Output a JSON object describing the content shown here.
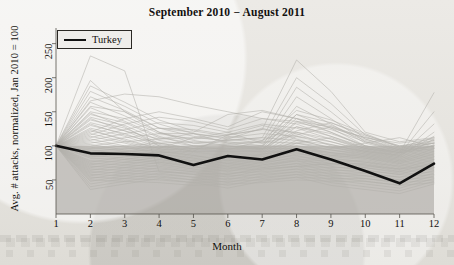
{
  "chart": {
    "title": "September 2010 − August 2011",
    "xlabel": "Month",
    "ylabel": "Avg. # attacks, normalized, Jan 2010 = 100",
    "legend_label": "Turkey"
  },
  "chart_data": {
    "type": "line",
    "title": "September 2010 − August 2011",
    "xlabel": "Month",
    "ylabel": "Avg. # attacks, normalized, Jan 2010 = 100",
    "xlim": [
      1,
      12
    ],
    "ylim": [
      0,
      270
    ],
    "xticks": [
      1,
      2,
      3,
      4,
      5,
      6,
      7,
      8,
      9,
      10,
      11,
      12
    ],
    "yticks": [
      50,
      100,
      150,
      200,
      250
    ],
    "grid": false,
    "legend": {
      "position": "top-left",
      "entries": [
        "Turkey"
      ]
    },
    "shaded_band": {
      "y_from": 0,
      "y_to": 100,
      "color": "#a9a7a1",
      "opacity": 0.62
    },
    "x": [
      1,
      2,
      3,
      4,
      5,
      6,
      7,
      8,
      9,
      10,
      11,
      12
    ],
    "highlight_series": {
      "name": "Turkey",
      "color": "#111111",
      "width": 2.6,
      "values": [
        100,
        89,
        88,
        86,
        72,
        85,
        80,
        95,
        80,
        63,
        45,
        74
      ]
    },
    "background_series_note": "~60 unlabeled country series drawn in light grey, all normalized to 100 at month 1",
    "series": [
      {
        "name": "country-01",
        "color": "#b3b1ab",
        "values": [
          100,
          232,
          210,
          62,
          60,
          58,
          66,
          70,
          74,
          70,
          66,
          72
        ]
      },
      {
        "name": "country-02",
        "color": "#b3b1ab",
        "values": [
          100,
          196,
          150,
          120,
          104,
          100,
          96,
          104,
          112,
          96,
          90,
          100
        ]
      },
      {
        "name": "country-03",
        "color": "#b3b1ab",
        "values": [
          100,
          166,
          176,
          172,
          160,
          150,
          140,
          136,
          128,
          112,
          100,
          104
        ]
      },
      {
        "name": "country-04",
        "color": "#b3b1ab",
        "values": [
          100,
          158,
          150,
          126,
          120,
          146,
          152,
          140,
          126,
          112,
          104,
          110
        ]
      },
      {
        "name": "country-05",
        "color": "#b3b1ab",
        "values": [
          100,
          150,
          140,
          118,
          110,
          116,
          124,
          226,
          180,
          120,
          106,
          112
        ]
      },
      {
        "name": "country-06",
        "color": "#b3b1ab",
        "values": [
          100,
          146,
          134,
          112,
          104,
          108,
          112,
          200,
          162,
          116,
          100,
          108
        ]
      },
      {
        "name": "country-07",
        "color": "#b3b1ab",
        "values": [
          100,
          142,
          130,
          108,
          100,
          102,
          106,
          186,
          150,
          110,
          96,
          104
        ]
      },
      {
        "name": "country-08",
        "color": "#b3b1ab",
        "values": [
          100,
          138,
          126,
          104,
          96,
          98,
          100,
          172,
          140,
          106,
          94,
          100
        ]
      },
      {
        "name": "country-09",
        "color": "#b3b1ab",
        "values": [
          100,
          134,
          122,
          102,
          94,
          96,
          98,
          158,
          132,
          104,
          92,
          98
        ]
      },
      {
        "name": "country-10",
        "color": "#b3b1ab",
        "values": [
          100,
          130,
          118,
          100,
          92,
          94,
          96,
          146,
          126,
          100,
          90,
          96
        ]
      },
      {
        "name": "country-11",
        "color": "#b3b1ab",
        "values": [
          100,
          126,
          114,
          98,
          90,
          92,
          94,
          136,
          120,
          98,
          88,
          94
        ]
      },
      {
        "name": "country-12",
        "color": "#b3b1ab",
        "values": [
          100,
          122,
          110,
          96,
          88,
          90,
          92,
          128,
          114,
          96,
          86,
          92
        ]
      },
      {
        "name": "country-13",
        "color": "#b3b1ab",
        "values": [
          100,
          118,
          106,
          94,
          86,
          88,
          90,
          120,
          110,
          94,
          84,
          90
        ]
      },
      {
        "name": "country-14",
        "color": "#b3b1ab",
        "values": [
          100,
          114,
          104,
          92,
          84,
          86,
          88,
          114,
          106,
          92,
          82,
          88
        ]
      },
      {
        "name": "country-15",
        "color": "#b3b1ab",
        "values": [
          100,
          110,
          100,
          90,
          82,
          84,
          86,
          108,
          102,
          90,
          80,
          86
        ]
      },
      {
        "name": "country-16",
        "color": "#b3b1ab",
        "values": [
          100,
          106,
          98,
          88,
          80,
          82,
          84,
          104,
          98,
          88,
          78,
          84
        ]
      },
      {
        "name": "country-17",
        "color": "#b3b1ab",
        "values": [
          100,
          102,
          94,
          86,
          78,
          80,
          82,
          100,
          94,
          86,
          76,
          82
        ]
      },
      {
        "name": "country-18",
        "color": "#b3b1ab",
        "values": [
          100,
          98,
          92,
          84,
          76,
          78,
          80,
          96,
          90,
          84,
          74,
          80
        ]
      },
      {
        "name": "country-19",
        "color": "#b3b1ab",
        "values": [
          100,
          94,
          88,
          82,
          74,
          76,
          78,
          92,
          86,
          82,
          72,
          78
        ]
      },
      {
        "name": "country-20",
        "color": "#b3b1ab",
        "values": [
          100,
          90,
          86,
          80,
          72,
          74,
          76,
          88,
          84,
          80,
          70,
          76
        ]
      },
      {
        "name": "country-21",
        "color": "#b3b1ab",
        "values": [
          100,
          86,
          82,
          78,
          70,
          72,
          74,
          84,
          80,
          78,
          68,
          74
        ]
      },
      {
        "name": "country-22",
        "color": "#b3b1ab",
        "values": [
          100,
          82,
          80,
          76,
          68,
          70,
          72,
          80,
          78,
          76,
          66,
          72
        ]
      },
      {
        "name": "country-23",
        "color": "#b3b1ab",
        "values": [
          100,
          78,
          76,
          74,
          66,
          68,
          70,
          78,
          74,
          74,
          64,
          70
        ]
      },
      {
        "name": "country-24",
        "color": "#b3b1ab",
        "values": [
          100,
          74,
          72,
          70,
          64,
          66,
          68,
          74,
          72,
          72,
          62,
          68
        ]
      },
      {
        "name": "country-25",
        "color": "#b3b1ab",
        "values": [
          100,
          70,
          68,
          66,
          62,
          64,
          66,
          70,
          68,
          68,
          60,
          66
        ]
      },
      {
        "name": "country-26",
        "color": "#b3b1ab",
        "values": [
          100,
          66,
          64,
          62,
          58,
          60,
          62,
          66,
          64,
          64,
          58,
          62
        ]
      },
      {
        "name": "country-27",
        "color": "#b3b1ab",
        "values": [
          100,
          62,
          60,
          58,
          54,
          56,
          58,
          62,
          60,
          60,
          54,
          58
        ]
      },
      {
        "name": "country-28",
        "color": "#b3b1ab",
        "values": [
          100,
          58,
          56,
          54,
          50,
          52,
          54,
          58,
          56,
          56,
          50,
          54
        ]
      },
      {
        "name": "country-29",
        "color": "#b3b1ab",
        "values": [
          100,
          54,
          52,
          50,
          46,
          48,
          50,
          54,
          52,
          52,
          46,
          50
        ]
      },
      {
        "name": "country-30",
        "color": "#b3b1ab",
        "values": [
          100,
          50,
          48,
          46,
          42,
          44,
          46,
          50,
          48,
          48,
          42,
          46
        ]
      },
      {
        "name": "country-31",
        "color": "#b3b1ab",
        "values": [
          100,
          120,
          140,
          150,
          140,
          128,
          150,
          140,
          120,
          100,
          92,
          100
        ]
      },
      {
        "name": "country-32",
        "color": "#b3b1ab",
        "values": [
          100,
          116,
          132,
          142,
          136,
          124,
          140,
          132,
          114,
          98,
          90,
          178
        ]
      },
      {
        "name": "country-33",
        "color": "#b3b1ab",
        "values": [
          100,
          112,
          124,
          134,
          130,
          120,
          132,
          126,
          110,
          96,
          88,
          150
        ]
      },
      {
        "name": "country-34",
        "color": "#b3b1ab",
        "values": [
          100,
          108,
          118,
          126,
          124,
          116,
          124,
          120,
          106,
          94,
          86,
          132
        ]
      },
      {
        "name": "country-35",
        "color": "#b3b1ab",
        "values": [
          100,
          104,
          112,
          118,
          118,
          112,
          118,
          114,
          102,
          92,
          84,
          120
        ]
      },
      {
        "name": "country-36",
        "color": "#b3b1ab",
        "values": [
          100,
          100,
          106,
          110,
          112,
          108,
          112,
          108,
          98,
          90,
          82,
          110
        ]
      },
      {
        "name": "country-37",
        "color": "#b3b1ab",
        "values": [
          100,
          96,
          100,
          104,
          106,
          104,
          106,
          104,
          94,
          88,
          80,
          102
        ]
      },
      {
        "name": "country-38",
        "color": "#b3b1ab",
        "values": [
          100,
          92,
          96,
          98,
          100,
          100,
          100,
          100,
          90,
          86,
          78,
          96
        ]
      },
      {
        "name": "country-39",
        "color": "#b3b1ab",
        "values": [
          100,
          88,
          92,
          94,
          96,
          96,
          96,
          96,
          88,
          84,
          76,
          92
        ]
      },
      {
        "name": "country-40",
        "color": "#b3b1ab",
        "values": [
          100,
          84,
          88,
          90,
          92,
          92,
          92,
          92,
          86,
          82,
          74,
          88
        ]
      },
      {
        "name": "country-41",
        "color": "#b3b1ab",
        "values": [
          100,
          124,
          108,
          96,
          112,
          120,
          104,
          116,
          128,
          108,
          94,
          104
        ]
      },
      {
        "name": "country-42",
        "color": "#b3b1ab",
        "values": [
          100,
          132,
          116,
          104,
          96,
          110,
          126,
          110,
          96,
          104,
          112,
          98
        ]
      },
      {
        "name": "country-43",
        "color": "#b3b1ab",
        "values": [
          100,
          140,
          122,
          110,
          118,
          104,
          96,
          122,
          134,
          116,
          98,
          106
        ]
      },
      {
        "name": "country-44",
        "color": "#b3b1ab",
        "values": [
          100,
          148,
          128,
          100,
          92,
          116,
          130,
          118,
          100,
          92,
          86,
          114
        ]
      },
      {
        "name": "country-45",
        "color": "#b3b1ab",
        "values": [
          100,
          156,
          136,
          114,
          100,
          94,
          108,
          128,
          118,
          100,
          90,
          96
        ]
      },
      {
        "name": "country-46",
        "color": "#b3b1ab",
        "values": [
          100,
          164,
          144,
          120,
          108,
          100,
          94,
          134,
          124,
          106,
          92,
          100
        ]
      },
      {
        "name": "country-47",
        "color": "#b3b1ab",
        "values": [
          100,
          172,
          152,
          126,
          114,
          106,
          100,
          140,
          130,
          110,
          94,
          104
        ]
      },
      {
        "name": "country-48",
        "color": "#b3b1ab",
        "values": [
          100,
          180,
          158,
          132,
          118,
          110,
          104,
          146,
          134,
          114,
          96,
          108
        ]
      },
      {
        "name": "country-49",
        "color": "#b3b1ab",
        "values": [
          100,
          188,
          164,
          138,
          122,
          114,
          108,
          152,
          138,
          118,
          98,
          112
        ]
      },
      {
        "name": "country-50",
        "color": "#b3b1ab",
        "values": [
          100,
          76,
          84,
          92,
          86,
          78,
          88,
          94,
          82,
          76,
          70,
          84
        ]
      },
      {
        "name": "country-51",
        "color": "#b3b1ab",
        "values": [
          100,
          72,
          80,
          88,
          82,
          74,
          84,
          90,
          78,
          72,
          66,
          80
        ]
      },
      {
        "name": "country-52",
        "color": "#b3b1ab",
        "values": [
          100,
          68,
          76,
          84,
          78,
          70,
          80,
          86,
          74,
          68,
          62,
          76
        ]
      },
      {
        "name": "country-53",
        "color": "#b3b1ab",
        "values": [
          100,
          64,
          72,
          80,
          74,
          66,
          76,
          82,
          70,
          64,
          58,
          72
        ]
      },
      {
        "name": "country-54",
        "color": "#b3b1ab",
        "values": [
          100,
          60,
          68,
          76,
          70,
          62,
          72,
          78,
          66,
          60,
          54,
          68
        ]
      },
      {
        "name": "country-55",
        "color": "#b3b1ab",
        "values": [
          100,
          56,
          64,
          72,
          66,
          58,
          68,
          74,
          62,
          56,
          50,
          64
        ]
      },
      {
        "name": "country-56",
        "color": "#b3b1ab",
        "values": [
          100,
          52,
          60,
          68,
          62,
          54,
          64,
          70,
          58,
          52,
          46,
          60
        ]
      },
      {
        "name": "country-57",
        "color": "#b3b1ab",
        "values": [
          100,
          48,
          56,
          64,
          58,
          50,
          60,
          66,
          54,
          48,
          42,
          56
        ]
      },
      {
        "name": "country-58",
        "color": "#b3b1ab",
        "values": [
          100,
          44,
          52,
          60,
          54,
          46,
          56,
          62,
          50,
          44,
          38,
          52
        ]
      },
      {
        "name": "country-59",
        "color": "#b3b1ab",
        "values": [
          100,
          40,
          48,
          56,
          50,
          42,
          52,
          58,
          46,
          40,
          34,
          48
        ]
      },
      {
        "name": "country-60",
        "color": "#b3b1ab",
        "values": [
          100,
          36,
          44,
          52,
          46,
          38,
          48,
          54,
          42,
          36,
          30,
          44
        ]
      }
    ]
  }
}
